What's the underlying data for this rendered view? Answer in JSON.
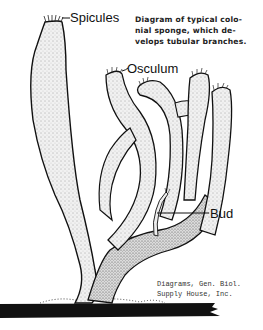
{
  "diagram": {
    "labels": {
      "spicules": "Spicules",
      "osculum": "Osculum",
      "bud": "Bud"
    },
    "caption": {
      "lines": [
        "Diagram of typical colo-",
        "nial sponge, which de-",
        "velops tubular branches."
      ]
    },
    "credit": {
      "lines": [
        "Diagrams, Gen. Biol.",
        "Supply House, Inc."
      ]
    },
    "colors": {
      "ink": "#111111",
      "fill": "#e8e8e8",
      "background": "#ffffff"
    }
  }
}
